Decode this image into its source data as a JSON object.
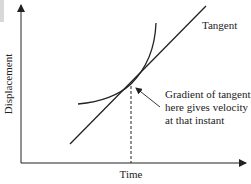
{
  "diagram": {
    "type": "displacement-time graph with tangent",
    "x_axis_label": "Time",
    "y_axis_label": "Displacement",
    "tangent_label": "Tangent",
    "annotation_lines": [
      "Gradient of tangent",
      "here gives velocity",
      "at that instant"
    ],
    "colors": {
      "ink": "#222222",
      "background": "#ffffff",
      "corner_mark": "#d8d8d8"
    }
  }
}
